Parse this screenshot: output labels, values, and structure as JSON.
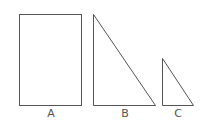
{
  "diagram": {
    "shapes": [
      {
        "id": "A",
        "type": "rectangle",
        "label": "A"
      },
      {
        "id": "B",
        "type": "right-triangle",
        "label": "B"
      },
      {
        "id": "C",
        "type": "right-triangle",
        "label": "C"
      }
    ],
    "stroke_color": "#555555"
  }
}
